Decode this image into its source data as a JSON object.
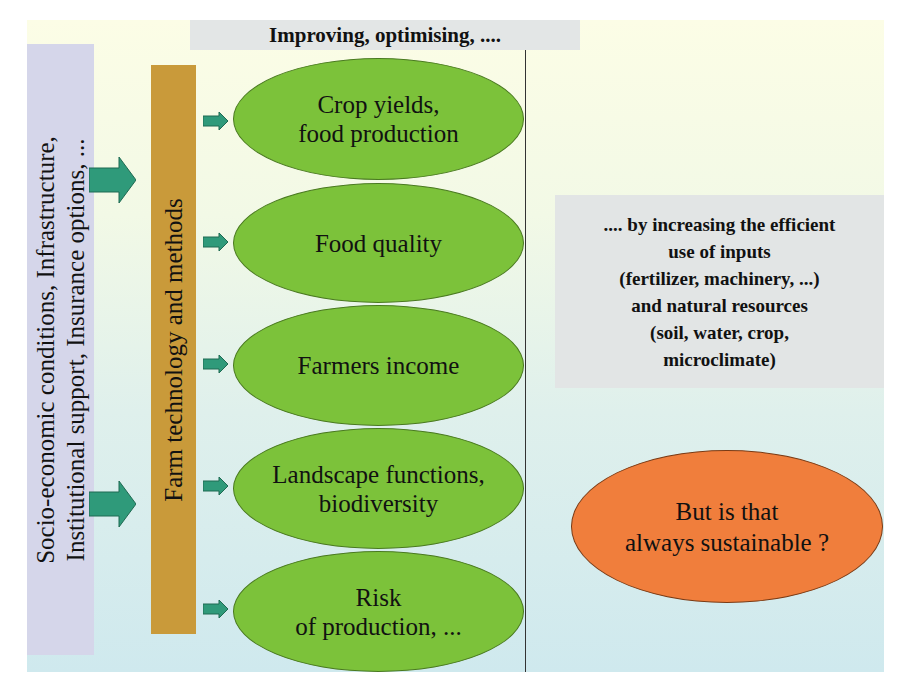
{
  "title": "Improving, optimising, ....",
  "side_label": "Socio-economic conditions, Infrastructure,\nInstitutional support, Insurance options, ...",
  "tech_label": "Farm technology and methods",
  "outcomes": [
    {
      "label": "Crop yields,\nfood production"
    },
    {
      "label": "Food quality"
    },
    {
      "label": "Farmers income"
    },
    {
      "label": "Landscape functions,\nbiodiversity"
    },
    {
      "label": "Risk\nof production, ..."
    }
  ],
  "info": ".... by increasing the efficient\nuse of inputs\n(fertilizer, machinery, ...)\nand natural resources\n(soil, water, crop,\nmicroclimate)",
  "question": "But is that\nalways sustainable ?",
  "colors": {
    "ellipse_green": "#7cc23a",
    "arrow_teal": "#2f9a7a",
    "tech_bar": "#c99a3a",
    "side_box": "#d5d6ea",
    "question_orange": "#f07e3c"
  }
}
